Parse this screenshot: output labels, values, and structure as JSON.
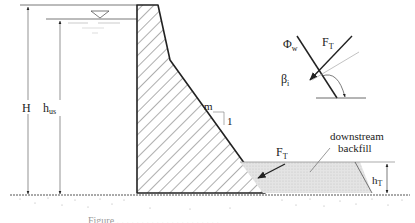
{
  "figure": {
    "labels": {
      "H": "H",
      "h_us_main": "h",
      "h_us_sub": "us",
      "slope_m": "m",
      "slope_1": "1",
      "F_T_detail_main": "F",
      "F_T_detail_sub": "T",
      "phi_w_main": "Φ",
      "phi_w_sub": "w",
      "beta_main": "β",
      "beta_sub": "i",
      "F_T_main": "F",
      "F_T_sub": "T",
      "backfill_line1": "downstream",
      "backfill_line2": "backfill",
      "h_T_main": "h",
      "h_T_sub": "T"
    },
    "caption": "Figure ... (caption truncated at bottom edge)",
    "colors": {
      "line": "#222222",
      "hatch": "#333333",
      "backfill_fill": "#e2e2e2",
      "ground_speckle": "#9a9a9a",
      "thin_line": "#9a9a9a"
    }
  }
}
